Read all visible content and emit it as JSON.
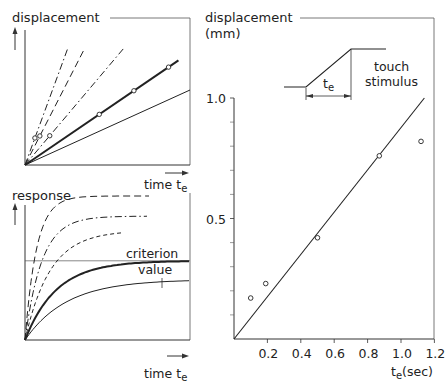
{
  "chart_data": [
    {
      "type": "line",
      "panel": "top-left",
      "title": "",
      "ylabel": "displacement",
      "xlabel": "time t",
      "xlabel_sub": "e",
      "description": "Displacement ramps of increasing slope vs time; open circles mark the time t_e at which each ramp reaches the response criterion",
      "series": [
        {
          "name": "ramp-1",
          "style": "dash-dot",
          "slope_rel": 6.0,
          "marker_t": 0.06
        },
        {
          "name": "ramp-2",
          "style": "long-dash",
          "slope_rel": 4.3,
          "marker_t": 0.09
        },
        {
          "name": "ramp-3",
          "style": "dash-dot",
          "slope_rel": 2.6,
          "marker_t": 0.15
        },
        {
          "name": "ramp-4",
          "style": "thick-solid",
          "slope_rel": 1.5,
          "marker_t": [
            0.45,
            0.66,
            0.87
          ]
        },
        {
          "name": "ramp-5",
          "style": "thin-solid",
          "slope_rel": 1.0,
          "marker_t": null
        }
      ]
    },
    {
      "type": "line",
      "panel": "bottom-left",
      "ylabel": "response",
      "xlabel": "time t",
      "xlabel_sub": "e",
      "annotation": "criterion value",
      "criterion_level": 0.55,
      "series": [
        {
          "name": "resp-1",
          "style": "long-dash",
          "plateau": 1.0
        },
        {
          "name": "resp-2",
          "style": "dash-dot",
          "plateau": 0.86
        },
        {
          "name": "resp-3",
          "style": "short-dash",
          "plateau": 0.76
        },
        {
          "name": "resp-4",
          "style": "thick-solid",
          "plateau": 0.55
        },
        {
          "name": "resp-5",
          "style": "thin-solid",
          "plateau": 0.42
        }
      ]
    },
    {
      "type": "scatter",
      "panel": "right",
      "ylabel": "displacement",
      "ylabel_unit": "(mm)",
      "xlabel": "t",
      "xlabel_sub": "e",
      "xlabel_unit": "(sec)",
      "xlim": [
        0,
        1.2
      ],
      "ylim": [
        0,
        1.0
      ],
      "x_ticks": [
        "0.2",
        "0.4",
        "0.6",
        "0.8",
        "1.0",
        "1.2"
      ],
      "x_tick_values": [
        0.2,
        0.4,
        0.6,
        0.8,
        1.0,
        1.2
      ],
      "y_ticks": [
        "0.5",
        "1.0"
      ],
      "y_tick_values": [
        0.5,
        1.0
      ],
      "y_minor_ticks": [
        0.1,
        0.2,
        0.3,
        0.4,
        0.6,
        0.7,
        0.8,
        0.9
      ],
      "points": [
        {
          "x": 0.1,
          "y": 0.17
        },
        {
          "x": 0.19,
          "y": 0.23
        },
        {
          "x": 0.5,
          "y": 0.42
        },
        {
          "x": 0.87,
          "y": 0.76
        },
        {
          "x": 1.12,
          "y": 0.82
        }
      ],
      "fit_line": {
        "x": [
          0,
          1.14
        ],
        "y": [
          0,
          1.0
        ]
      },
      "inset": {
        "label_line1": "touch",
        "label_line2": "stimulus",
        "duration_label": "t",
        "duration_sub": "e"
      }
    }
  ]
}
